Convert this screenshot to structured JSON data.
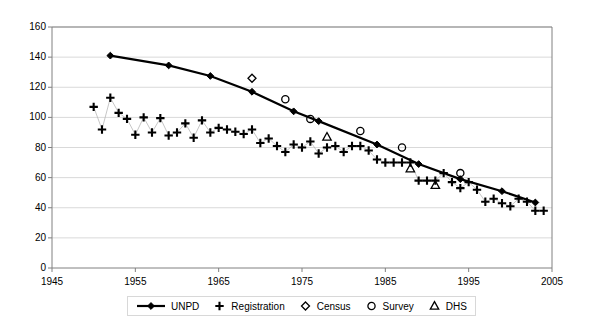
{
  "chart_data": {
    "type": "scatter",
    "title": "",
    "xlabel": "",
    "ylabel": "",
    "xlim": [
      1945,
      2005
    ],
    "ylim": [
      0,
      160
    ],
    "xticks": [
      1945,
      1955,
      1965,
      1975,
      1985,
      1995,
      2005
    ],
    "yticks": [
      0,
      20,
      40,
      60,
      80,
      100,
      120,
      140,
      160
    ],
    "grid": "horizontal",
    "legend_position": "bottom-center",
    "series": [
      {
        "name": "UNPD",
        "marker": "filled-diamond",
        "line": true,
        "points": [
          [
            1952,
            141
          ],
          [
            1959,
            134.5
          ],
          [
            1964,
            127.5
          ],
          [
            1969,
            117
          ],
          [
            1974,
            104
          ],
          [
            1977,
            97.5
          ],
          [
            1984,
            82
          ],
          [
            1989,
            69
          ],
          [
            1994,
            59
          ],
          [
            1999,
            51
          ],
          [
            2003,
            43.5
          ]
        ]
      },
      {
        "name": "Registration",
        "marker": "plus",
        "line": true,
        "points": [
          [
            1950,
            107
          ],
          [
            1951,
            92
          ],
          [
            1952,
            113
          ],
          [
            1953,
            103
          ],
          [
            1954,
            99
          ],
          [
            1955,
            88.5
          ],
          [
            1956,
            100
          ],
          [
            1957,
            90
          ],
          [
            1958,
            99.5
          ],
          [
            1959,
            88
          ],
          [
            1960,
            90
          ],
          [
            1961,
            96
          ],
          [
            1962,
            86.5
          ],
          [
            1963,
            98
          ],
          [
            1964,
            90
          ],
          [
            1965,
            93
          ],
          [
            1966,
            92
          ],
          [
            1967,
            90.5
          ],
          [
            1968,
            89
          ],
          [
            1969,
            92
          ],
          [
            1970,
            83
          ],
          [
            1971,
            86
          ],
          [
            1972,
            81
          ],
          [
            1973,
            77
          ],
          [
            1974,
            82
          ],
          [
            1975,
            80
          ],
          [
            1976,
            84
          ],
          [
            1977,
            76
          ],
          [
            1978,
            80
          ],
          [
            1979,
            81
          ],
          [
            1980,
            77
          ],
          [
            1981,
            81
          ],
          [
            1982,
            81
          ],
          [
            1983,
            78
          ],
          [
            1984,
            72
          ],
          [
            1985,
            70
          ],
          [
            1986,
            70
          ],
          [
            1987,
            70
          ],
          [
            1988,
            70
          ],
          [
            1989,
            58
          ],
          [
            1990,
            58
          ],
          [
            1991,
            58
          ],
          [
            1992,
            63
          ],
          [
            1993,
            57
          ],
          [
            1994,
            53
          ],
          [
            1995,
            57
          ],
          [
            1996,
            52
          ],
          [
            1997,
            44
          ],
          [
            1998,
            46
          ],
          [
            1999,
            43
          ],
          [
            2000,
            41
          ],
          [
            2001,
            46
          ],
          [
            2002,
            44
          ],
          [
            2003,
            38
          ],
          [
            2004,
            38
          ]
        ]
      },
      {
        "name": "Census",
        "marker": "open-diamond",
        "line": false,
        "points": [
          [
            1969,
            126
          ]
        ]
      },
      {
        "name": "Survey",
        "marker": "open-circle",
        "line": false,
        "points": [
          [
            1973,
            112
          ],
          [
            1976,
            99
          ],
          [
            1982,
            91
          ],
          [
            1987,
            80
          ],
          [
            1994,
            63
          ]
        ]
      },
      {
        "name": "DHS",
        "marker": "open-triangle",
        "line": false,
        "points": [
          [
            1978,
            87
          ],
          [
            1988,
            66
          ],
          [
            1991,
            55
          ]
        ]
      }
    ]
  },
  "axes": {
    "y_tick_labels": [
      "160",
      "140",
      "120",
      "100",
      "80",
      "60",
      "40",
      "20",
      "0"
    ],
    "x_tick_labels": [
      "1945",
      "1955",
      "1965",
      "1975",
      "1985",
      "1995",
      "2005"
    ]
  },
  "legend": {
    "items": [
      {
        "label": "UNPD",
        "symbol": "line-with-filled-diamond"
      },
      {
        "label": "Registration",
        "symbol": "plus"
      },
      {
        "label": "Census",
        "symbol": "open-diamond"
      },
      {
        "label": "Survey",
        "symbol": "open-circle"
      },
      {
        "label": "DHS",
        "symbol": "open-triangle"
      }
    ]
  },
  "colors": {
    "axis": "#808080",
    "grid": "#d9d9d9",
    "series": "#000000",
    "background": "#ffffff",
    "legend_border": "#d8d8d8"
  }
}
